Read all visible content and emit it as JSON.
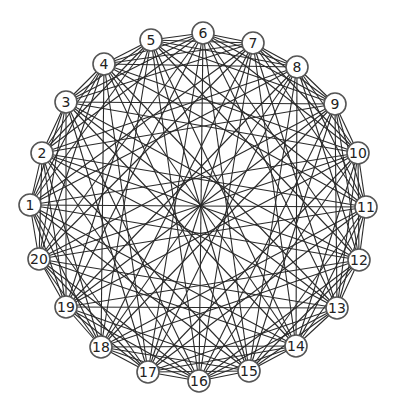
{
  "diagram": {
    "type": "circulant-graph",
    "node_count": 20,
    "center": [
      201,
      206
    ],
    "nodes": [
      {
        "id": 1,
        "label": "1",
        "x": 30,
        "y": 205
      },
      {
        "id": 2,
        "label": "2",
        "x": 42,
        "y": 153
      },
      {
        "id": 3,
        "label": "3",
        "x": 66,
        "y": 102
      },
      {
        "id": 4,
        "label": "4",
        "x": 104,
        "y": 64
      },
      {
        "id": 5,
        "label": "5",
        "x": 151,
        "y": 40
      },
      {
        "id": 6,
        "label": "6",
        "x": 203,
        "y": 33
      },
      {
        "id": 7,
        "label": "7",
        "x": 253,
        "y": 43
      },
      {
        "id": 8,
        "label": "8",
        "x": 297,
        "y": 67
      },
      {
        "id": 9,
        "label": "9",
        "x": 335,
        "y": 104
      },
      {
        "id": 10,
        "label": "10",
        "x": 358,
        "y": 153
      },
      {
        "id": 11,
        "label": "11",
        "x": 366,
        "y": 207
      },
      {
        "id": 12,
        "label": "12",
        "x": 359,
        "y": 260
      },
      {
        "id": 13,
        "label": "13",
        "x": 337,
        "y": 308
      },
      {
        "id": 14,
        "label": "14",
        "x": 296,
        "y": 346
      },
      {
        "id": 15,
        "label": "15",
        "x": 249,
        "y": 371
      },
      {
        "id": 16,
        "label": "16",
        "x": 199,
        "y": 381
      },
      {
        "id": 17,
        "label": "17",
        "x": 148,
        "y": 372
      },
      {
        "id": 18,
        "label": "18",
        "x": 101,
        "y": 347
      },
      {
        "id": 19,
        "label": "19",
        "x": 66,
        "y": 307
      },
      {
        "id": 20,
        "label": "20",
        "x": 39,
        "y": 259
      }
    ],
    "edge_offsets": [
      1,
      2,
      3,
      4,
      6,
      7,
      9,
      10
    ],
    "style": {
      "edge_color": "#2a2a2a",
      "node_fill": "#ffffff",
      "node_stroke": "#555555",
      "node_radius": 11
    }
  }
}
